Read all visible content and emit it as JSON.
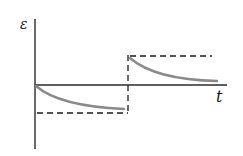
{
  "diagram": {
    "y_axis_label": "ε",
    "x_axis_label": "t",
    "colors": {
      "axis": "#2a2a2a",
      "dashed": "#1a1a1a",
      "curve": "#8a8a8a",
      "background": "#ffffff"
    },
    "elements": {
      "lower_step_level": "negative constant (dashed)",
      "upper_step_level": "positive constant (dashed)",
      "switch_time": "vertical dashed transition",
      "curve_1": "decay from 0 toward negative level",
      "curve_2": "decay from positive level toward 0"
    }
  }
}
